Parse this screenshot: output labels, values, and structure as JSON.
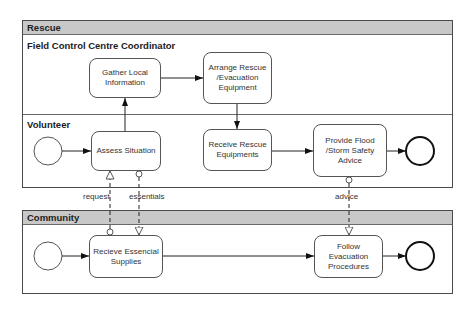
{
  "diagram": {
    "type": "BPMN collaboration diagram",
    "pools": [
      {
        "id": "rescue",
        "label": "Rescue",
        "lanes": [
          {
            "id": "coordinator",
            "label": "Field Control Centre Coordinator"
          },
          {
            "id": "volunteer",
            "label": "Volunteer"
          }
        ]
      },
      {
        "id": "community",
        "label": "Community"
      }
    ],
    "tasks": {
      "gather": "Gather Local Information",
      "arrange": "Arrange Rescue /Evacuation Equipment",
      "assess": "Assess Situation",
      "receive_rescue": "Receive Rescue Equipments",
      "provide_advice": "Provide Flood /Storm Safety Advice",
      "recieve_supplies": "Recieve Essencial Supplies",
      "follow": "Follow Evacuation Procedures"
    },
    "message_flows": {
      "request": "request",
      "essentials": "essentials",
      "advice": "advice"
    },
    "events": {
      "volunteer_start": "start-event",
      "volunteer_end": "end-event",
      "community_start": "start-event",
      "community_end": "end-event"
    },
    "sequence_flows": [
      [
        "volunteer_start",
        "assess"
      ],
      [
        "assess",
        "gather"
      ],
      [
        "gather",
        "arrange"
      ],
      [
        "arrange",
        "receive_rescue"
      ],
      [
        "receive_rescue",
        "provide_advice"
      ],
      [
        "provide_advice",
        "volunteer_end"
      ],
      [
        "community_start",
        "recieve_supplies"
      ],
      [
        "recieve_supplies",
        "follow"
      ],
      [
        "follow",
        "community_end"
      ]
    ],
    "message_flow_links": [
      {
        "label": "request",
        "from": "recieve_supplies",
        "to": "assess"
      },
      {
        "label": "essentials",
        "from": "assess",
        "to": "recieve_supplies"
      },
      {
        "label": "advice",
        "from": "provide_advice",
        "to": "follow"
      }
    ],
    "colors": {
      "pool_header": "#c8c8c8",
      "border": "#4a4a4a",
      "task_border": "#555555"
    }
  }
}
